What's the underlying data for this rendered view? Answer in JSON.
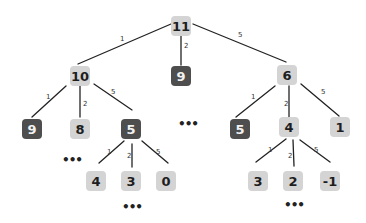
{
  "diagram": {
    "type": "tree",
    "colors": {
      "light_node": "#d4d4d4",
      "dark_node": "#4e4e4e",
      "edge": "#222222"
    },
    "nodes": [
      {
        "id": "n11",
        "label": "11",
        "x": 181,
        "y": 26,
        "style": "light"
      },
      {
        "id": "n10",
        "label": "10",
        "x": 80,
        "y": 76,
        "style": "light"
      },
      {
        "id": "n9a",
        "label": "9",
        "x": 181,
        "y": 76,
        "style": "dark"
      },
      {
        "id": "n6",
        "label": "6",
        "x": 287,
        "y": 75,
        "style": "light"
      },
      {
        "id": "n9b",
        "label": "9",
        "x": 32,
        "y": 129,
        "style": "dark"
      },
      {
        "id": "n8",
        "label": "8",
        "x": 80,
        "y": 129,
        "style": "light"
      },
      {
        "id": "n5a",
        "label": "5",
        "x": 131,
        "y": 129,
        "style": "dark"
      },
      {
        "id": "n5b",
        "label": "5",
        "x": 240,
        "y": 129,
        "style": "dark"
      },
      {
        "id": "n4a",
        "label": "4",
        "x": 289,
        "y": 127,
        "style": "light"
      },
      {
        "id": "n1",
        "label": "1",
        "x": 340,
        "y": 127,
        "style": "light"
      },
      {
        "id": "n4b",
        "label": "4",
        "x": 96,
        "y": 181,
        "style": "light"
      },
      {
        "id": "n3a",
        "label": "3",
        "x": 131,
        "y": 181,
        "style": "light"
      },
      {
        "id": "n0",
        "label": "0",
        "x": 166,
        "y": 181,
        "style": "light"
      },
      {
        "id": "n3b",
        "label": "3",
        "x": 258,
        "y": 181,
        "style": "light"
      },
      {
        "id": "n2",
        "label": "2",
        "x": 293,
        "y": 181,
        "style": "light"
      },
      {
        "id": "nm1",
        "label": "-1",
        "x": 330,
        "y": 181,
        "style": "light"
      }
    ],
    "edges": [
      {
        "from": "n11",
        "to": "n10",
        "label": "1",
        "x1": 171,
        "y1": 24,
        "x2": 78,
        "y2": 64,
        "lx": 120,
        "ly": 35
      },
      {
        "from": "n11",
        "to": "n9a",
        "label": "2",
        "x1": 181,
        "y1": 36,
        "x2": 181,
        "y2": 65,
        "lx": 184,
        "ly": 42
      },
      {
        "from": "n11",
        "to": "n6",
        "label": "5",
        "x1": 193,
        "y1": 24,
        "x2": 286,
        "y2": 62,
        "lx": 238,
        "ly": 31
      },
      {
        "from": "n10",
        "to": "n9b",
        "label": "1",
        "x1": 66,
        "y1": 86,
        "x2": 32,
        "y2": 117,
        "lx": 46,
        "ly": 93
      },
      {
        "from": "n10",
        "to": "n8",
        "label": "2",
        "x1": 80,
        "y1": 86,
        "x2": 80,
        "y2": 117,
        "lx": 83,
        "ly": 100
      },
      {
        "from": "n10",
        "to": "n5a",
        "label": "5",
        "x1": 94,
        "y1": 84,
        "x2": 132,
        "y2": 110,
        "lx": 111,
        "ly": 88
      },
      {
        "from": "n6",
        "to": "n5b",
        "label": "1",
        "x1": 275,
        "y1": 86,
        "x2": 236,
        "y2": 117,
        "lx": 251,
        "ly": 93
      },
      {
        "from": "n6",
        "to": "n4a",
        "label": "2",
        "x1": 289,
        "y1": 86,
        "x2": 289,
        "y2": 117,
        "lx": 284,
        "ly": 100
      },
      {
        "from": "n6",
        "to": "n1",
        "label": "5",
        "x1": 301,
        "y1": 84,
        "x2": 339,
        "y2": 116,
        "lx": 321,
        "ly": 88
      },
      {
        "from": "n5a",
        "to": "n4b",
        "label": "1",
        "x1": 124,
        "y1": 141,
        "x2": 99,
        "y2": 163,
        "lx": 107,
        "ly": 148
      },
      {
        "from": "n5a",
        "to": "n3a",
        "label": "2",
        "x1": 132,
        "y1": 144,
        "x2": 132,
        "y2": 167,
        "lx": 127,
        "ly": 152
      },
      {
        "from": "n5a",
        "to": "n0",
        "label": "5",
        "x1": 142,
        "y1": 141,
        "x2": 168,
        "y2": 163,
        "lx": 156,
        "ly": 148
      },
      {
        "from": "n4a",
        "to": "n3b",
        "label": "1",
        "x1": 286,
        "y1": 139,
        "x2": 256,
        "y2": 162,
        "lx": 268,
        "ly": 146
      },
      {
        "from": "n4a",
        "to": "n2",
        "label": "2",
        "x1": 293,
        "y1": 140,
        "x2": 294,
        "y2": 166,
        "lx": 288,
        "ly": 152
      },
      {
        "from": "n4a",
        "to": "nm1",
        "label": "5",
        "x1": 300,
        "y1": 140,
        "x2": 330,
        "y2": 162,
        "lx": 314,
        "ly": 146
      }
    ],
    "ellipses": [
      {
        "text": "•••",
        "x": 186,
        "y": 124
      },
      {
        "text": "•••",
        "x": 70,
        "y": 160
      },
      {
        "text": "•••",
        "x": 130,
        "y": 207
      },
      {
        "text": "•••",
        "x": 292,
        "y": 205
      }
    ]
  }
}
